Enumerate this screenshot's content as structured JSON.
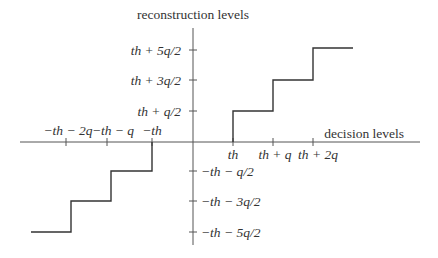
{
  "diagram": {
    "type": "quantizer-staircase",
    "y_axis_title": "reconstruction levels",
    "x_axis_title": "decision levels",
    "y_ticks": [
      {
        "label": "th + 5q/2"
      },
      {
        "label": "th + 3q/2"
      },
      {
        "label": "th + q/2"
      },
      {
        "label": "−th − q/2"
      },
      {
        "label": "−th − 3q/2"
      },
      {
        "label": "−th − 5q/2"
      }
    ],
    "x_ticks": [
      {
        "label": "−th − 2q"
      },
      {
        "label": "−th − q"
      },
      {
        "label": "−th"
      },
      {
        "label": "th"
      },
      {
        "label": "th + q"
      },
      {
        "label": "th + 2q"
      }
    ],
    "line_color": "#333333",
    "axis_color": "#555555"
  }
}
